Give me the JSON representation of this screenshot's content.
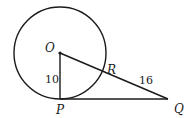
{
  "diagram": {
    "colors": {
      "stroke": "#1a1a1a",
      "background": "#ffffff"
    },
    "circle": {
      "center": "O",
      "cx": 60,
      "cy": 53,
      "r": 46
    },
    "points": {
      "O": {
        "label": "O",
        "x": 60,
        "y": 53
      },
      "P": {
        "label": "P",
        "x": 60,
        "y": 99
      },
      "Q": {
        "label": "Q",
        "x": 168,
        "y": 99
      },
      "R": {
        "label": "R",
        "x": 102,
        "y": 72
      }
    },
    "segments": [
      {
        "from": "O",
        "to": "P",
        "length_label": "10"
      },
      {
        "from": "P",
        "to": "Q",
        "length_label": ""
      },
      {
        "from": "O",
        "to": "Q",
        "length_label": ""
      },
      {
        "from": "R",
        "to": "Q",
        "length_label": "16"
      }
    ],
    "labels": {
      "O": "O",
      "P": "P",
      "Q": "Q",
      "R": "R",
      "OP": "10",
      "RQ": "16"
    }
  }
}
